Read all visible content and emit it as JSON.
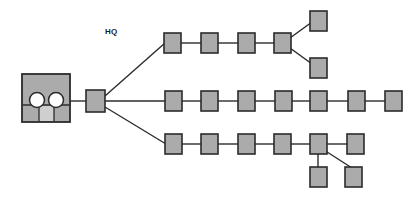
{
  "diagram": {
    "title_label": "HQ",
    "colors": {
      "node_fill": "#ababab",
      "node_stroke": "#2b2b2b",
      "link_stroke": "#2b2b2b",
      "building_fill": "#ababab",
      "building_panel_light": "#cfcfcf",
      "dome_fill": "#fdfdfd",
      "background": "#ffffff"
    },
    "canvas": {
      "width": 418,
      "height": 199
    },
    "headquarters": {
      "name": "headquarters-building",
      "x": 22,
      "y": 74,
      "width": 48,
      "height": 48,
      "divider_y": 105,
      "domes": [
        {
          "cx": 37,
          "cy": 101,
          "r": 8
        },
        {
          "cx": 56,
          "cy": 101,
          "r": 8
        }
      ],
      "panel_lines_x": [
        38,
        54
      ],
      "light_panel": {
        "x": 39,
        "y": 106,
        "width": 14,
        "height": 15
      }
    },
    "hub": {
      "name": "hub-node",
      "x": 86,
      "y": 90,
      "width": 19,
      "height": 22
    },
    "node_size": {
      "width": 17,
      "height": 20
    },
    "branches": [
      {
        "name": "top-branch",
        "nodes": [
          {
            "id": "t1",
            "x": 164,
            "y": 33
          },
          {
            "id": "t2",
            "x": 201,
            "y": 33
          },
          {
            "id": "t3",
            "x": 238,
            "y": 33
          },
          {
            "id": "t4",
            "x": 274,
            "y": 33
          },
          {
            "id": "t5",
            "x": 309,
            "y": 11
          },
          {
            "id": "t6",
            "x": 309,
            "y": 58
          }
        ]
      },
      {
        "name": "middle-branch",
        "nodes": [
          {
            "id": "m1",
            "x": 165,
            "y": 91
          },
          {
            "id": "m2",
            "x": 201,
            "y": 91
          },
          {
            "id": "m3",
            "x": 238,
            "y": 91
          },
          {
            "id": "m4",
            "x": 275,
            "y": 91
          },
          {
            "id": "m5",
            "x": 310,
            "y": 91
          },
          {
            "id": "m6",
            "x": 348,
            "y": 91
          },
          {
            "id": "m7",
            "x": 385,
            "y": 91
          }
        ]
      },
      {
        "name": "bottom-branch",
        "nodes": [
          {
            "id": "b1",
            "x": 165,
            "y": 134
          },
          {
            "id": "b2",
            "x": 201,
            "y": 134
          },
          {
            "id": "b3",
            "x": 238,
            "y": 134
          },
          {
            "id": "b4",
            "x": 274,
            "y": 134
          },
          {
            "id": "b5",
            "x": 310,
            "y": 134
          },
          {
            "id": "b6",
            "x": 347,
            "y": 134
          },
          {
            "id": "b7",
            "x": 310,
            "y": 167
          },
          {
            "id": "b8",
            "x": 345,
            "y": 167
          }
        ]
      }
    ],
    "links": [
      {
        "name": "link-building-to-hub",
        "x1": 70,
        "y1": 101,
        "x2": 86,
        "y2": 101
      },
      {
        "name": "link-hub-to-top",
        "x1": 105,
        "y1": 96,
        "x2": 164,
        "y2": 43
      },
      {
        "name": "link-hub-to-middle",
        "x1": 105,
        "y1": 101,
        "x2": 165,
        "y2": 101
      },
      {
        "name": "link-hub-to-bottom",
        "x1": 105,
        "y1": 106,
        "x2": 165,
        "y2": 144
      },
      {
        "name": "link-t1-t2",
        "x1": 181,
        "y1": 43,
        "x2": 201,
        "y2": 43
      },
      {
        "name": "link-t2-t3",
        "x1": 218,
        "y1": 43,
        "x2": 238,
        "y2": 43
      },
      {
        "name": "link-t3-t4",
        "x1": 255,
        "y1": 43,
        "x2": 274,
        "y2": 43
      },
      {
        "name": "link-t4-t5",
        "x1": 291,
        "y1": 39,
        "x2": 311,
        "y2": 21
      },
      {
        "name": "link-t4-t6",
        "x1": 291,
        "y1": 48,
        "x2": 311,
        "y2": 64
      },
      {
        "name": "link-m1-m2",
        "x1": 182,
        "y1": 101,
        "x2": 201,
        "y2": 101
      },
      {
        "name": "link-m2-m3",
        "x1": 218,
        "y1": 101,
        "x2": 238,
        "y2": 101
      },
      {
        "name": "link-m3-m4",
        "x1": 255,
        "y1": 101,
        "x2": 275,
        "y2": 101
      },
      {
        "name": "link-m4-m5",
        "x1": 292,
        "y1": 101,
        "x2": 310,
        "y2": 101
      },
      {
        "name": "link-m5-m6",
        "x1": 327,
        "y1": 101,
        "x2": 348,
        "y2": 101
      },
      {
        "name": "link-m6-m7",
        "x1": 365,
        "y1": 101,
        "x2": 385,
        "y2": 101
      },
      {
        "name": "link-b1-b2",
        "x1": 182,
        "y1": 144,
        "x2": 201,
        "y2": 144
      },
      {
        "name": "link-b2-b3",
        "x1": 218,
        "y1": 144,
        "x2": 238,
        "y2": 144
      },
      {
        "name": "link-b3-b4",
        "x1": 255,
        "y1": 144,
        "x2": 274,
        "y2": 144
      },
      {
        "name": "link-b4-b5",
        "x1": 291,
        "y1": 144,
        "x2": 310,
        "y2": 144
      },
      {
        "name": "link-b5-b6",
        "x1": 327,
        "y1": 144,
        "x2": 347,
        "y2": 144
      },
      {
        "name": "link-b5-b7",
        "x1": 318,
        "y1": 154,
        "x2": 318,
        "y2": 167
      },
      {
        "name": "link-b5-b8",
        "x1": 324,
        "y1": 150,
        "x2": 351,
        "y2": 168
      }
    ],
    "label_position": {
      "x": 105,
      "y": 34
    }
  }
}
